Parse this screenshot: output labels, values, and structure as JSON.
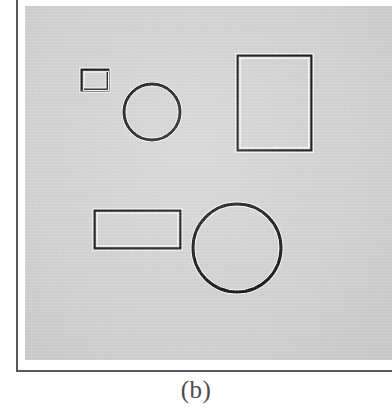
{
  "figure": {
    "caption": "(b)",
    "plate": {
      "background_color": "#d2d2d2",
      "left": 25,
      "top": 6,
      "width": 367,
      "height": 354
    },
    "border_color": "#555a60",
    "edge_dark_color": "#111111",
    "edge_light_color": "#ffffff",
    "shapes": [
      {
        "name": "small-rectangle",
        "type": "rect",
        "x": 57,
        "y": 64,
        "width": 26,
        "height": 20,
        "stroke_width": 3
      },
      {
        "name": "small-circle",
        "type": "circle",
        "cx": 127,
        "cy": 106,
        "r": 28,
        "stroke_width": 3
      },
      {
        "name": "large-rectangle",
        "type": "rect",
        "x": 213,
        "y": 50,
        "width": 73,
        "height": 94,
        "stroke_width": 3
      },
      {
        "name": "wide-rectangle",
        "type": "rect",
        "x": 70,
        "y": 205,
        "width": 85,
        "height": 37,
        "stroke_width": 3
      },
      {
        "name": "large-circle",
        "type": "circle",
        "cx": 212,
        "cy": 242,
        "r": 44,
        "stroke_width": 3
      }
    ]
  }
}
